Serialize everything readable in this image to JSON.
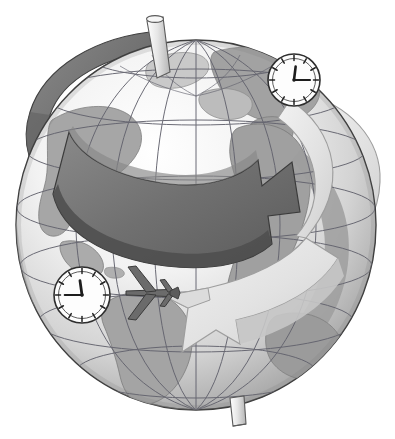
{
  "illustration": {
    "title": "World time zones globe with rotation arrows, clocks and airplane",
    "subject": "globe",
    "style": "grayscale line-art clipart",
    "background_color": "#ffffff"
  },
  "palette": {
    "background": "#ffffff",
    "ocean": "#ffffff",
    "land_light": "#d8d8d8",
    "land_mid": "#a8a8a8",
    "land_dark": "#8f8f8f",
    "globe_shadow": "#9a9a9a",
    "globe_shadow_deep": "#7e7e7e",
    "grid_line": "#5a5a5a",
    "outline": "#3a3a3a",
    "arrow_dark_top": "#6e6e6e",
    "arrow_dark_side": "#525252",
    "arrow_light_top": "#e3e3e3",
    "arrow_light_side": "#c2c2c2",
    "clock_face": "#fdfdfd",
    "clock_rim": "#2e2e2e",
    "clock_hand": "#1d1d1d",
    "plane_body": "#6b6b6b",
    "plane_outline": "#3a3a3a",
    "axis_pin": "#d0d0d0"
  },
  "globe": {
    "name": "earth-globe",
    "center_x": 196,
    "center_y": 225,
    "radius_x": 180,
    "radius_y": 185,
    "tilt_degrees": 0,
    "grid": {
      "meridians": 12,
      "parallels": 7,
      "visible": true
    },
    "continents_visible": [
      "North America",
      "Central America",
      "South America",
      "Greenland",
      "Europe",
      "Africa",
      "Asia",
      "Middle East"
    ],
    "poles": {
      "north_pin_label": "north-pole-axis-pin",
      "south_pin_label": "south-pole-axis-pin"
    }
  },
  "arrows": [
    {
      "name": "rotation-arrow-dark",
      "position": "upper hemisphere band",
      "direction": "eastward",
      "heading": "right-down",
      "tone": "dark gray",
      "color": "#6e6e6e",
      "meaning": "earth rotation"
    },
    {
      "name": "rotation-arrow-light",
      "position": "equatorial band",
      "direction": "westward",
      "heading": "left-down",
      "tone": "light gray",
      "color": "#e3e3e3",
      "meaning": "flight direction against rotation"
    }
  ],
  "clocks": [
    {
      "name": "clock-top-right",
      "location_hint": "over Europe / Mediterranean",
      "center_x": 294,
      "center_y": 80,
      "radius": 26,
      "hour": 12,
      "minute": 15,
      "time_label": "12:15",
      "hour_angle_deg": 7,
      "minute_angle_deg": 90,
      "tick_count": 12
    },
    {
      "name": "clock-bottom-left",
      "location_hint": "over Central America",
      "center_x": 82,
      "center_y": 295,
      "radius": 28,
      "hour": 12,
      "minute": 45,
      "time_label": "12:45",
      "hour_angle_deg": 352,
      "minute_angle_deg": 270,
      "tick_count": 12
    }
  ],
  "airplane": {
    "name": "airplane-silhouette",
    "center_x": 150,
    "center_y": 293,
    "heading": "west",
    "view": "top-down",
    "wingspan_px": 56,
    "length_px": 44,
    "color": "#6b6b6b"
  },
  "caption": {
    "alt_text": "A grayscale globe showing the Americas, Europe and Africa, encircled by a dark arrow turning eastward over the northern hemisphere and a pale arrow sweeping westward across the equator. A clock reading 12:15 sits over Europe, a clock reading 12:45 sits over Central America, and an airliner flies west across the Caribbean."
  }
}
